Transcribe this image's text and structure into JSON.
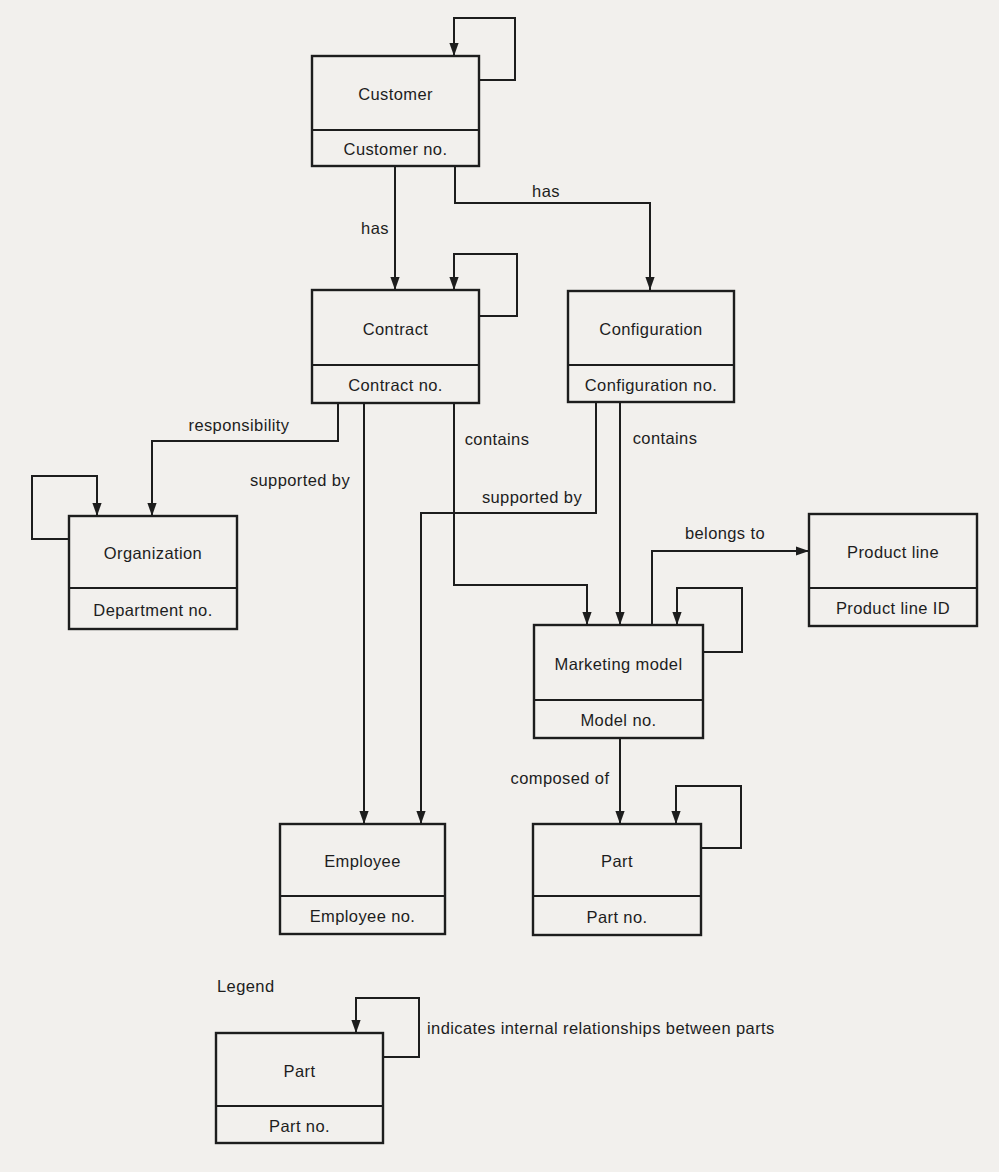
{
  "canvas": {
    "width": 999,
    "height": 1172,
    "background": "#f2f0ed",
    "ink": "#1d1d1d"
  },
  "entities": [
    {
      "id": "customer",
      "name": "Customer",
      "attribute": "Customer no.",
      "x": 312,
      "y": 56,
      "w": 167,
      "h": 110,
      "divider_y": 130
    },
    {
      "id": "contract",
      "name": "Contract",
      "attribute": "Contract no.",
      "x": 312,
      "y": 290,
      "w": 167,
      "h": 113,
      "divider_y": 365
    },
    {
      "id": "configuration",
      "name": "Configuration",
      "attribute": "Configuration no.",
      "x": 568,
      "y": 291,
      "w": 166,
      "h": 111,
      "divider_y": 365
    },
    {
      "id": "organization",
      "name": "Organization",
      "attribute": "Department no.",
      "x": 69,
      "y": 516,
      "w": 168,
      "h": 113,
      "divider_y": 588
    },
    {
      "id": "marketing-model",
      "name": "Marketing model",
      "attribute": "Model no.",
      "x": 534,
      "y": 625,
      "w": 169,
      "h": 113,
      "divider_y": 700
    },
    {
      "id": "product-line",
      "name": "Product line",
      "attribute": "Product line ID",
      "x": 809,
      "y": 514,
      "w": 168,
      "h": 112,
      "divider_y": 588
    },
    {
      "id": "employee",
      "name": "Employee",
      "attribute": "Employee no.",
      "x": 280,
      "y": 824,
      "w": 165,
      "h": 110,
      "divider_y": 896
    },
    {
      "id": "part",
      "name": "Part",
      "attribute": "Part no.",
      "x": 533,
      "y": 824,
      "w": 168,
      "h": 111,
      "divider_y": 896
    },
    {
      "id": "legend-part",
      "name": "Part",
      "attribute": "Part no.",
      "x": 216,
      "y": 1033,
      "w": 167,
      "h": 110,
      "divider_y": 1106
    }
  ],
  "connectors": [
    {
      "id": "customer-self-loop",
      "label": "",
      "points": [
        [
          479,
          80
        ],
        [
          515,
          80
        ],
        [
          515,
          18
        ],
        [
          454,
          18
        ],
        [
          454,
          56
        ]
      ]
    },
    {
      "id": "customer-has-contract",
      "label": "has",
      "label_x": 375,
      "label_y": 228,
      "points": [
        [
          395,
          166
        ],
        [
          395,
          290
        ]
      ]
    },
    {
      "id": "customer-has-configuration",
      "label": "has",
      "label_x": 546,
      "label_y": 191,
      "points": [
        [
          455,
          166
        ],
        [
          455,
          203
        ],
        [
          650,
          203
        ],
        [
          650,
          290
        ]
      ]
    },
    {
      "id": "contract-self-loop",
      "label": "",
      "points": [
        [
          479,
          316
        ],
        [
          517,
          316
        ],
        [
          517,
          254
        ],
        [
          454,
          254
        ],
        [
          454,
          290
        ]
      ]
    },
    {
      "id": "contract-responsibility-organization",
      "label": "responsibility",
      "label_x": 239,
      "label_y": 425,
      "points": [
        [
          338,
          403
        ],
        [
          338,
          441
        ],
        [
          152,
          441
        ],
        [
          152,
          516
        ]
      ]
    },
    {
      "id": "contract-supported-by-employee",
      "label": "supported by",
      "label_x": 300,
      "label_y": 480,
      "points": [
        [
          364,
          403
        ],
        [
          364,
          824
        ]
      ]
    },
    {
      "id": "contract-contains-marketing-model",
      "label": "contains",
      "label_x": 497,
      "label_y": 439,
      "points": [
        [
          454,
          403
        ],
        [
          454,
          585
        ],
        [
          587,
          585
        ],
        [
          587,
          625
        ]
      ]
    },
    {
      "id": "configuration-contains-marketing-model",
      "label": "contains",
      "label_x": 665,
      "label_y": 438,
      "points": [
        [
          620,
          402
        ],
        [
          620,
          625
        ]
      ]
    },
    {
      "id": "configuration-supported-by-employee",
      "label": "supported by",
      "label_x": 532,
      "label_y": 497,
      "points": [
        [
          596,
          402
        ],
        [
          596,
          513
        ],
        [
          421,
          513
        ],
        [
          421,
          824
        ]
      ]
    },
    {
      "id": "organization-self-loop",
      "label": "",
      "points": [
        [
          69,
          539
        ],
        [
          32,
          539
        ],
        [
          32,
          476
        ],
        [
          97,
          476
        ],
        [
          97,
          516
        ]
      ]
    },
    {
      "id": "marketing-model-belongs-to-product-line",
      "label": "belongs to",
      "label_x": 725,
      "label_y": 533,
      "points": [
        [
          652,
          625
        ],
        [
          652,
          551
        ],
        [
          809,
          551
        ]
      ]
    },
    {
      "id": "marketing-model-self-loop",
      "label": "",
      "points": [
        [
          703,
          652
        ],
        [
          742,
          652
        ],
        [
          742,
          588
        ],
        [
          677,
          588
        ],
        [
          677,
          625
        ]
      ]
    },
    {
      "id": "marketing-model-composed-of-part",
      "label": "composed of",
      "label_x": 560,
      "label_y": 778,
      "points": [
        [
          620,
          738
        ],
        [
          620,
          824
        ]
      ]
    },
    {
      "id": "part-self-loop",
      "label": "",
      "points": [
        [
          701,
          848
        ],
        [
          741,
          848
        ],
        [
          741,
          786
        ],
        [
          676,
          786
        ],
        [
          676,
          824
        ]
      ]
    },
    {
      "id": "legend-part-self-loop",
      "label": "",
      "points": [
        [
          383,
          1057
        ],
        [
          419,
          1057
        ],
        [
          419,
          998
        ],
        [
          356,
          998
        ],
        [
          356,
          1033
        ]
      ]
    }
  ],
  "legend": {
    "title": "Legend",
    "title_x": 217,
    "title_y": 986,
    "note": "indicates internal relationships between parts",
    "note_x": 427,
    "note_y": 1028
  }
}
